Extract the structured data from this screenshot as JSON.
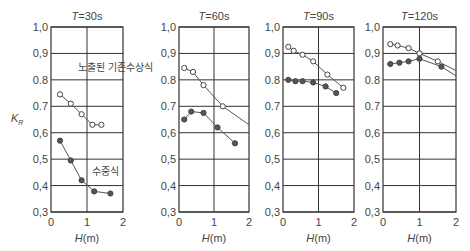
{
  "chart_data": [
    {
      "type": "line",
      "title": "T=30s",
      "xlabel": "H(m)",
      "ylabel": "K_R",
      "xlim": [
        0,
        2
      ],
      "ylim": [
        0.3,
        1.0
      ],
      "xticks": [
        "0",
        "1",
        "2"
      ],
      "yticks": [
        "0.3",
        "0.4",
        "0.5",
        "0.6",
        "0.7",
        "0.8",
        "0.9",
        "1.0"
      ],
      "grid": true,
      "annotations": [
        "노출된 기존수상식",
        "수중식"
      ],
      "series": [
        {
          "name": "노출된 기존수상식",
          "marker": "open-circle",
          "x": [
            0.25,
            0.55,
            0.85,
            1.15,
            1.4
          ],
          "y": [
            0.745,
            0.71,
            0.67,
            0.63,
            0.63
          ]
        },
        {
          "name": "수중식",
          "marker": "filled-circle",
          "x": [
            0.25,
            0.55,
            0.85,
            1.2,
            1.65
          ],
          "y": [
            0.57,
            0.495,
            0.42,
            0.378,
            0.37
          ]
        }
      ]
    },
    {
      "type": "line",
      "title": "T=60s",
      "xlabel": "H(m)",
      "xlim": [
        0,
        2
      ],
      "ylim": [
        0.3,
        1.0
      ],
      "xticks": [
        "0",
        "1",
        "2"
      ],
      "yticks": [
        "0.3",
        "0.4",
        "0.5",
        "0.6",
        "0.7",
        "0.8",
        "0.9",
        "1.0"
      ],
      "grid": true,
      "series": [
        {
          "name": "노출된 기존수상식",
          "marker": "open-circle",
          "x": [
            0.15,
            0.4,
            0.7,
            1.25
          ],
          "y": [
            0.845,
            0.83,
            0.78,
            0.7
          ],
          "trend_end": [
            2.0,
            0.63
          ]
        },
        {
          "name": "수중식",
          "marker": "filled-circle",
          "x": [
            0.15,
            0.35,
            0.7,
            1.1,
            1.6
          ],
          "y": [
            0.65,
            0.68,
            0.675,
            0.62,
            0.56
          ]
        }
      ]
    },
    {
      "type": "line",
      "title": "T=90s",
      "xlabel": "H(m)",
      "xlim": [
        0,
        2
      ],
      "ylim": [
        0.3,
        1.0
      ],
      "xticks": [
        "0",
        "1",
        "2"
      ],
      "yticks": [
        "0.3",
        "0.4",
        "0.5",
        "0.6",
        "0.7",
        "0.8",
        "0.9",
        "1.0"
      ],
      "grid": true,
      "series": [
        {
          "name": "노출된 기존수상식",
          "marker": "open-circle",
          "x": [
            0.15,
            0.3,
            0.55,
            0.85,
            1.25,
            1.7
          ],
          "y": [
            0.925,
            0.91,
            0.895,
            0.87,
            0.82,
            0.77
          ]
        },
        {
          "name": "수중식",
          "marker": "filled-circle",
          "x": [
            0.15,
            0.35,
            0.55,
            0.85,
            1.2,
            1.5
          ],
          "y": [
            0.8,
            0.795,
            0.795,
            0.79,
            0.775,
            0.75
          ]
        }
      ]
    },
    {
      "type": "line",
      "title": "T=120s",
      "xlabel": "H(m)",
      "xlim": [
        0,
        2
      ],
      "ylim": [
        0.3,
        1.0
      ],
      "xticks": [
        "0",
        "1",
        "2"
      ],
      "yticks": [
        "0.3",
        "0.4",
        "0.5",
        "0.6",
        "0.7",
        "0.8",
        "0.9",
        "1.0"
      ],
      "grid": true,
      "series": [
        {
          "name": "노출된 기존수상식",
          "marker": "open-circle",
          "x": [
            0.2,
            0.4,
            0.7,
            1.0,
            1.5
          ],
          "y": [
            0.935,
            0.93,
            0.92,
            0.9,
            0.87
          ],
          "trend_end": [
            2.0,
            0.835
          ]
        },
        {
          "name": "수중식",
          "marker": "filled-circle",
          "x": [
            0.2,
            0.45,
            0.7,
            1.0,
            1.6
          ],
          "y": [
            0.86,
            0.865,
            0.87,
            0.88,
            0.85
          ],
          "trend_end": [
            2.0,
            0.815
          ]
        }
      ]
    }
  ],
  "labels": {
    "ylabel_main": "K",
    "ylabel_sub": "R",
    "legend_exposed": "노출된 기존수상식",
    "legend_submerged": "수중식",
    "xlabel": "H(m)"
  },
  "colors": {
    "frame": "#333333",
    "grid": "#333333",
    "line": "#555555",
    "open_marker_fill": "#ffffff",
    "filled_marker_fill": "#555555"
  }
}
